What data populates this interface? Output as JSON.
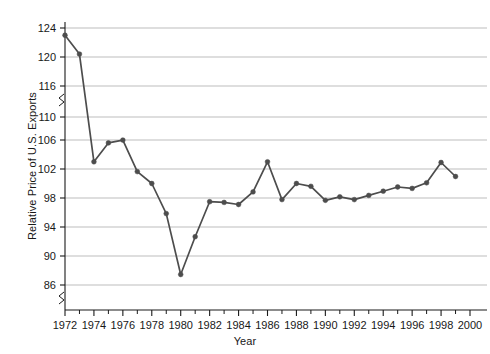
{
  "chart_data": {
    "type": "line",
    "title": "",
    "xlabel": "Year",
    "ylabel": "Relative Price of U.S. Exports",
    "x": [
      1972,
      1973,
      1974,
      1975,
      1976,
      1977,
      1978,
      1979,
      1980,
      1981,
      1982,
      1983,
      1984,
      1985,
      1986,
      1987,
      1988,
      1989,
      1990,
      1991,
      1992,
      1993,
      1994,
      1995,
      1996,
      1997,
      1998,
      1999
    ],
    "values": [
      123.0,
      120.4,
      103.6,
      106.3,
      106.7,
      102.2,
      100.5,
      96.2,
      87.5,
      92.9,
      97.9,
      97.8,
      97.5,
      99.3,
      103.6,
      98.2,
      100.5,
      100.1,
      98.1,
      98.6,
      98.2,
      98.8,
      99.4,
      100.0,
      99.8,
      100.6,
      103.5,
      101.5
    ],
    "series": [
      {
        "name": "Relative Price of U.S. Exports",
        "values": [
          123.0,
          120.4,
          103.6,
          106.3,
          106.7,
          102.2,
          100.5,
          96.2,
          87.5,
          92.9,
          97.9,
          97.8,
          97.5,
          99.3,
          103.6,
          98.2,
          100.5,
          100.1,
          98.1,
          98.6,
          98.2,
          98.8,
          99.4,
          100.0,
          99.8,
          100.6,
          103.5,
          101.5
        ]
      }
    ],
    "x_ticks": [
      1972,
      1974,
      1976,
      1978,
      1980,
      1982,
      1984,
      1986,
      1988,
      1990,
      1992,
      1994,
      1996,
      1998,
      2000
    ],
    "x_minor_ticks": [
      1973,
      1975,
      1977,
      1979,
      1981,
      1983,
      1985,
      1987,
      1989,
      1991,
      1993,
      1995,
      1997,
      1999
    ],
    "y_ticks": [
      86,
      90,
      94,
      98,
      102,
      106,
      110,
      116,
      120,
      124
    ],
    "y_axis_break": {
      "below": 110,
      "above": 116,
      "present": true
    },
    "xlim": [
      1972,
      2000
    ],
    "grid": true,
    "grid_axis": "y",
    "legend": "none",
    "line_color": "#4d4d4d",
    "marker_color": "#4d4d4d",
    "marker_shape": "circle",
    "grid_color": "#b5b5b5",
    "axis_color": "#1a1a1a",
    "annotations": []
  }
}
